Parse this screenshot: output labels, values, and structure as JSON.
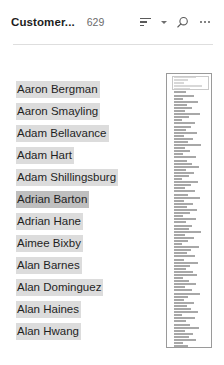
{
  "header": {
    "title": "Customer...",
    "count": "629",
    "sort_icon": "sort-lines-icon",
    "sort_caret_icon": "chevron-down-icon",
    "search_icon": "search-icon",
    "more_icon": "ellipsis-icon",
    "accent_color": "#dcdcdc",
    "selected_color": "#bfbfbf"
  },
  "list": {
    "items": [
      {
        "label": "Aaron Bergman",
        "selected": false
      },
      {
        "label": "Aaron Smayling",
        "selected": false
      },
      {
        "label": "Adam Bellavance",
        "selected": false
      },
      {
        "label": "Adam Hart",
        "selected": false
      },
      {
        "label": "Adam Shillingsburg",
        "selected": false
      },
      {
        "label": "Adrian Barton",
        "selected": true
      },
      {
        "label": "Adrian Hane",
        "selected": false
      },
      {
        "label": "Aimee Bixby",
        "selected": false
      },
      {
        "label": "Alan Barnes",
        "selected": false
      },
      {
        "label": "Alan Dominguez",
        "selected": false
      },
      {
        "label": "Alan Haines",
        "selected": false
      },
      {
        "label": "Alan Hwang",
        "selected": false
      }
    ]
  },
  "minimap": {
    "name": "list-minimap",
    "viewport_position": "top",
    "bar_widths": [
      22,
      14,
      10,
      28,
      16,
      12,
      20,
      9,
      24,
      13,
      18,
      11,
      26,
      15,
      8,
      21,
      17,
      12,
      23,
      10,
      19,
      14,
      27,
      11,
      16,
      9,
      22,
      13,
      18,
      25,
      12,
      20,
      15,
      8,
      24,
      17,
      11,
      21,
      14,
      26,
      10,
      19,
      13,
      23,
      16,
      9,
      22,
      12,
      18,
      15,
      27,
      11,
      20,
      14,
      8,
      25,
      17,
      13,
      21,
      10,
      24,
      16,
      12,
      19,
      23,
      9,
      15,
      22,
      11,
      18,
      26,
      14,
      10,
      20,
      13,
      17,
      24,
      8,
      21,
      12,
      16,
      25,
      11,
      19,
      15,
      22,
      9,
      14,
      27,
      13,
      18,
      10,
      23,
      16,
      12,
      20,
      17,
      11,
      24,
      15,
      8,
      21,
      13,
      19,
      26,
      10,
      14,
      22,
      12,
      18,
      16,
      9,
      25,
      11,
      20,
      15,
      23,
      13,
      17,
      10
    ]
  }
}
